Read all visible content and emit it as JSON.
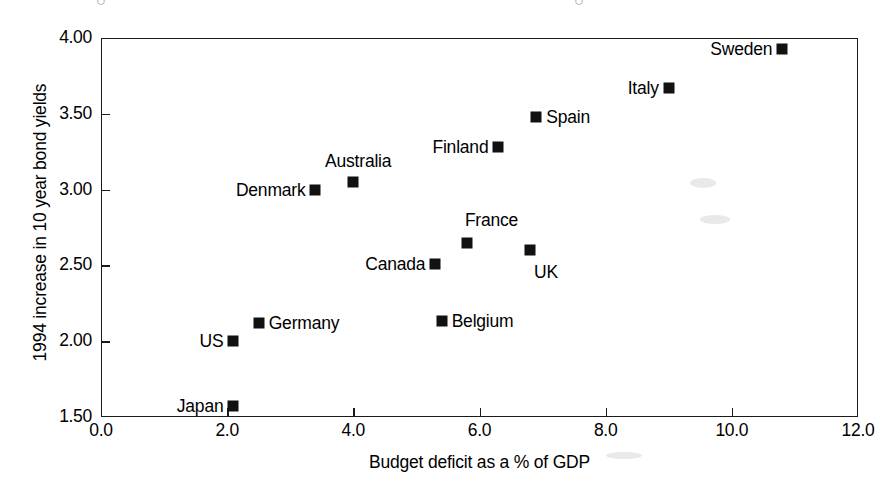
{
  "chart_data": {
    "type": "scatter",
    "title": "",
    "xlabel": "Budget deficit as a % of GDP",
    "ylabel": "1994 increase in 10 year bond yields",
    "xlim": [
      0.0,
      12.0
    ],
    "ylim": [
      1.5,
      4.0
    ],
    "xticks": [
      "0.0",
      "2.0",
      "4.0",
      "6.0",
      "8.0",
      "10.0",
      "12.0"
    ],
    "yticks": [
      "1.50",
      "2.00",
      "2.50",
      "3.00",
      "3.50",
      "4.00"
    ],
    "grid": false,
    "legend": "none",
    "marker_style": "filled-square",
    "marker_color": "#111111",
    "points": [
      {
        "label": "Japan",
        "x": 2.1,
        "y": 1.57,
        "label_pos": "left"
      },
      {
        "label": "US",
        "x": 2.1,
        "y": 2.0,
        "label_pos": "left"
      },
      {
        "label": "Germany",
        "x": 2.5,
        "y": 2.12,
        "label_pos": "right"
      },
      {
        "label": "Belgium",
        "x": 5.4,
        "y": 2.13,
        "label_pos": "right"
      },
      {
        "label": "Canada",
        "x": 5.3,
        "y": 2.51,
        "label_pos": "left"
      },
      {
        "label": "UK",
        "x": 6.8,
        "y": 2.6,
        "label_pos": "below-right"
      },
      {
        "label": "France",
        "x": 5.8,
        "y": 2.65,
        "label_pos": "above-right"
      },
      {
        "label": "Denmark",
        "x": 3.4,
        "y": 3.0,
        "label_pos": "left"
      },
      {
        "label": "Australia",
        "x": 4.0,
        "y": 3.05,
        "label_pos": "above"
      },
      {
        "label": "Finland",
        "x": 6.3,
        "y": 3.28,
        "label_pos": "left"
      },
      {
        "label": "Spain",
        "x": 6.9,
        "y": 3.48,
        "label_pos": "right"
      },
      {
        "label": "Italy",
        "x": 9.0,
        "y": 3.67,
        "label_pos": "left"
      },
      {
        "label": "Sweden",
        "x": 10.8,
        "y": 3.93,
        "label_pos": "left"
      }
    ]
  },
  "axes": {
    "x_axis_label": "Budget deficit as a % of GDP",
    "y_axis_label": "1994 increase in 10 year bond yields"
  }
}
